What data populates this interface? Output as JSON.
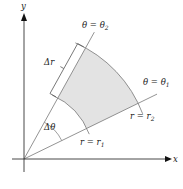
{
  "diagram": {
    "type": "polar-rectangle",
    "axes": {
      "x_label": "x",
      "y_label": "y"
    },
    "rays": [
      {
        "id": "theta1",
        "label_lhs": "θ",
        "label_eq": " = ",
        "label_rhs": "θ",
        "label_sub": "1",
        "angle_deg": 26
      },
      {
        "id": "theta2",
        "label_lhs": "θ",
        "label_eq": " = ",
        "label_rhs": "θ",
        "label_sub": "2",
        "angle_deg": 61
      }
    ],
    "arcs": [
      {
        "id": "r1",
        "label_lhs": "r",
        "label_eq": " = ",
        "label_rhs": "r",
        "label_sub": "1",
        "radius_ratio": 0.55
      },
      {
        "id": "r2",
        "label_lhs": "r",
        "label_eq": " = ",
        "label_rhs": "r",
        "label_sub": "2",
        "radius_ratio": 1.0
      }
    ],
    "delta_r": {
      "label": "Δr"
    },
    "delta_theta": {
      "label": "Δθ"
    },
    "colors": {
      "region_fill": "#e3e3e3",
      "line": "#777777",
      "axis": "#333333"
    }
  }
}
